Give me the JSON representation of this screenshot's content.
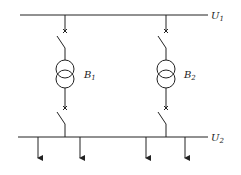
{
  "diagram": {
    "type": "single-line electrical diagram",
    "buses": [
      {
        "id": "U1",
        "label": "U",
        "subscript": "1",
        "position": "top"
      },
      {
        "id": "U2",
        "label": "U",
        "subscript": "2",
        "position": "bottom"
      }
    ],
    "transformers": [
      {
        "id": "B1",
        "label": "B",
        "subscript": "1"
      },
      {
        "id": "B2",
        "label": "B",
        "subscript": "2"
      }
    ],
    "feeders_count": 4,
    "colors": {
      "line": "#222222",
      "background": "#ffffff"
    }
  }
}
